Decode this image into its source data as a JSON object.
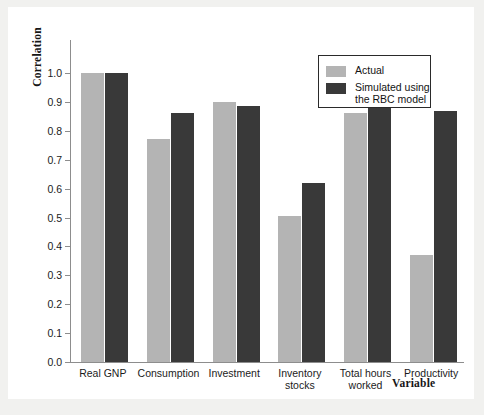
{
  "chart_data": {
    "type": "bar",
    "title": "",
    "xlabel": "Variable",
    "ylabel": "Correlation",
    "ylim": [
      0.0,
      1.0
    ],
    "grid": false,
    "legend_position": "top-right",
    "categories": [
      "Real GNP",
      "Consumption",
      "Investment",
      "Inventory\nstocks",
      "Total hours\nworked",
      "Productivity"
    ],
    "ytick_labels": [
      "1.0",
      "0.9",
      "0.8",
      "0.7",
      "0.6",
      "0.5",
      "0.4",
      "0.3",
      "0.2",
      "0.1",
      "0.0"
    ],
    "ytick_values": [
      1.0,
      0.9,
      0.8,
      0.7,
      0.6,
      0.5,
      0.4,
      0.3,
      0.2,
      0.1,
      0.0
    ],
    "series": [
      {
        "name": "Actual",
        "color": "#b4b4b4",
        "values": [
          1.0,
          0.77,
          0.9,
          0.505,
          0.86,
          0.37
        ]
      },
      {
        "name": "Simulated using\nthe RBC model",
        "color": "#393939",
        "values": [
          1.0,
          0.86,
          0.885,
          0.62,
          0.95,
          0.87
        ]
      }
    ]
  },
  "legend": {
    "entries": [
      {
        "label": "Actual",
        "color": "#b4b4b4"
      },
      {
        "label": "Simulated using\nthe RBC model",
        "color": "#393939"
      }
    ]
  },
  "colors": {
    "page_background": "#f1f1ef",
    "sheet_background": "#ffffff",
    "axis": "#8d8d8d",
    "text": "#1b1b1b",
    "actual_bar": "#b4b4b4",
    "simulated_bar": "#393939"
  }
}
